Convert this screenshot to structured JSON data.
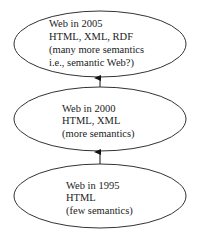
{
  "diagram": {
    "colors": {
      "stroke": "#333333",
      "text": "#222222",
      "background": "#ffffff"
    },
    "nodes": [
      {
        "id": "web2005",
        "lines": [
          "Web in 2005",
          "HTML, XML, RDF",
          "(many more semantics",
          "i.e., semantic Web?)"
        ]
      },
      {
        "id": "web2000",
        "lines": [
          "Web in 2000",
          "HTML, XML",
          "(more semantics)"
        ]
      },
      {
        "id": "web1995",
        "lines": [
          "Web in 1995",
          "HTML",
          "(few semantics)"
        ]
      }
    ],
    "edges": [
      {
        "from": "web1995",
        "to": "web2000"
      },
      {
        "from": "web2000",
        "to": "web2005"
      }
    ]
  }
}
